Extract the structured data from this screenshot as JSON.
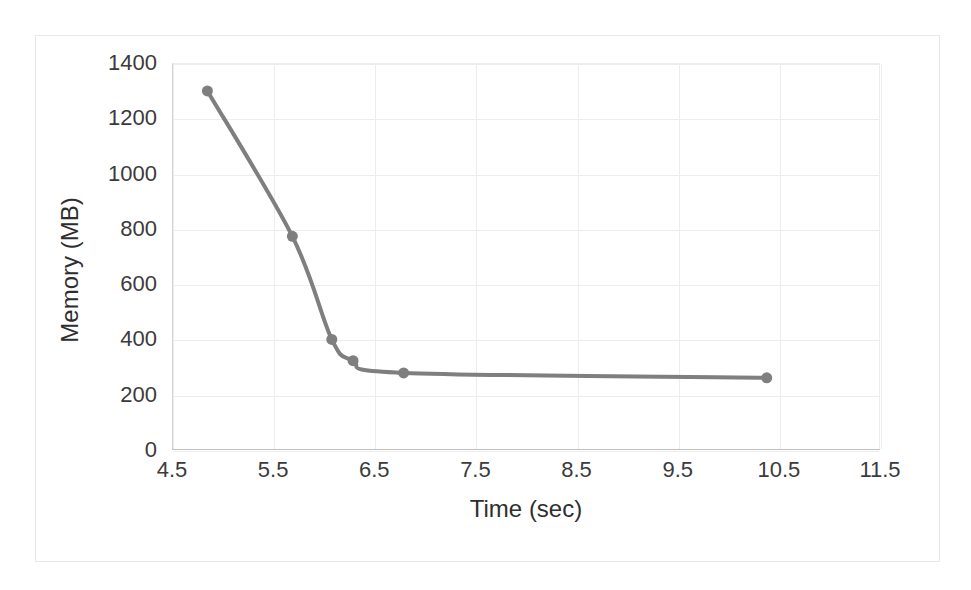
{
  "chart_data": {
    "type": "line",
    "title": "",
    "xlabel": "Time (sec)",
    "ylabel": "Memory (MB)",
    "xlim": [
      4.5,
      11.5
    ],
    "ylim": [
      0,
      1400
    ],
    "xticks": [
      "4.5",
      "5.5",
      "6.5",
      "7.5",
      "8.5",
      "9.5",
      "10.5",
      "11.5"
    ],
    "xtick_values": [
      4.5,
      5.5,
      6.5,
      7.5,
      8.5,
      9.5,
      10.5,
      11.5
    ],
    "yticks": [
      "0",
      "200",
      "400",
      "600",
      "800",
      "1000",
      "1200",
      "1400"
    ],
    "ytick_values": [
      0,
      200,
      400,
      600,
      800,
      1000,
      1200,
      1400
    ],
    "grid": true,
    "legend": "none",
    "marker": "circle",
    "marker_size": 11,
    "line_width": 4,
    "series_color": "#7f7f7f",
    "grid_color": "#ededed",
    "axis_color": "#bfbfbf",
    "text_color": "#3b3b3b",
    "background": "#ffffff",
    "series": [
      {
        "name": "Memory",
        "x": [
          4.85,
          5.69,
          6.08,
          6.29,
          6.79,
          10.38
        ],
        "y": [
          1299,
          773,
          400,
          323,
          279,
          261
        ]
      }
    ],
    "points": [
      {
        "x": 4.85,
        "y": 1299
      },
      {
        "x": 5.69,
        "y": 773
      },
      {
        "x": 6.08,
        "y": 400
      },
      {
        "x": 6.29,
        "y": 323
      },
      {
        "x": 6.79,
        "y": 279
      },
      {
        "x": 10.38,
        "y": 261
      }
    ]
  }
}
